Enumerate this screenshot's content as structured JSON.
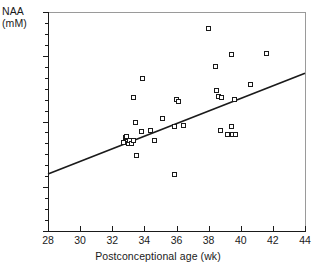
{
  "figure": {
    "background": "#ffffff",
    "ink": "#1a1a1a"
  },
  "axes": {
    "y_label_line1": "NAA",
    "y_label_line2": "(mM)",
    "x_label": "Postconceptional age (wk)",
    "x_ticks": [
      "28",
      "30",
      "32",
      "34",
      "36",
      "38",
      "40",
      "42",
      "44"
    ],
    "y_ticks": [
      "0",
      "2",
      "5",
      "8",
      "10"
    ]
  },
  "chart_data": {
    "type": "scatter",
    "title": "",
    "xlabel": "Postconceptional age (wk)",
    "ylabel": "NAA (mM)",
    "xlim": [
      28,
      44
    ],
    "ylim": [
      0,
      10
    ],
    "xticks": [
      28,
      30,
      32,
      34,
      36,
      38,
      40,
      42,
      44
    ],
    "yticks": [
      0,
      2,
      5,
      8,
      10
    ],
    "y_minor_tick_step": 0.5,
    "grid": false,
    "legend": null,
    "marker": "open-square",
    "series": [
      {
        "name": "NAA concentration",
        "x": [
          32.7,
          32.8,
          32.9,
          33.0,
          33.05,
          33.2,
          33.3,
          33.3,
          33.45,
          33.5,
          33.8,
          33.9,
          34.4,
          34.6,
          35.1,
          35.85,
          35.9,
          36.0,
          36.1,
          36.45,
          38.0,
          38.4,
          38.5,
          38.6,
          38.75,
          38.8,
          39.15,
          39.2,
          39.4,
          39.45,
          39.5,
          39.6,
          39.7,
          40.6,
          41.6
        ],
        "y": [
          4.05,
          4.25,
          4.3,
          4.0,
          4.15,
          4.0,
          6.1,
          4.15,
          4.95,
          3.45,
          4.55,
          6.95,
          4.6,
          4.15,
          5.15,
          4.75,
          2.6,
          6.0,
          5.9,
          4.8,
          9.25,
          7.5,
          6.4,
          6.15,
          4.6,
          6.1,
          4.4,
          4.4,
          8.05,
          4.75,
          4.4,
          6.0,
          4.4,
          6.7,
          8.1
        ]
      }
    ],
    "regression_line": {
      "label": "least-squares fit",
      "x_start": 28,
      "y_start": 2.6,
      "x_end": 44,
      "y_end": 7.2
    }
  }
}
